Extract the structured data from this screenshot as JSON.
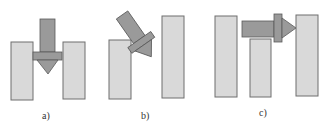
{
  "colors": {
    "pillar_fill": "#d9d9d9",
    "pillar_stroke": "#6e6e6e",
    "tool_fill": "#9a9a9a",
    "tool_stroke": "#5a5a5a"
  },
  "panels": [
    {
      "id": "a",
      "label": "a)",
      "description": "Downward arrow tool inserted vertically between two pillars"
    },
    {
      "id": "b",
      "label": "b)",
      "description": "Arrow tool inserted diagonally between a short left pillar and a tall right pillar"
    },
    {
      "id": "c",
      "label": "c)",
      "description": "Horizontal arrow tool passing above a middle pillar toward a right pillar"
    }
  ]
}
